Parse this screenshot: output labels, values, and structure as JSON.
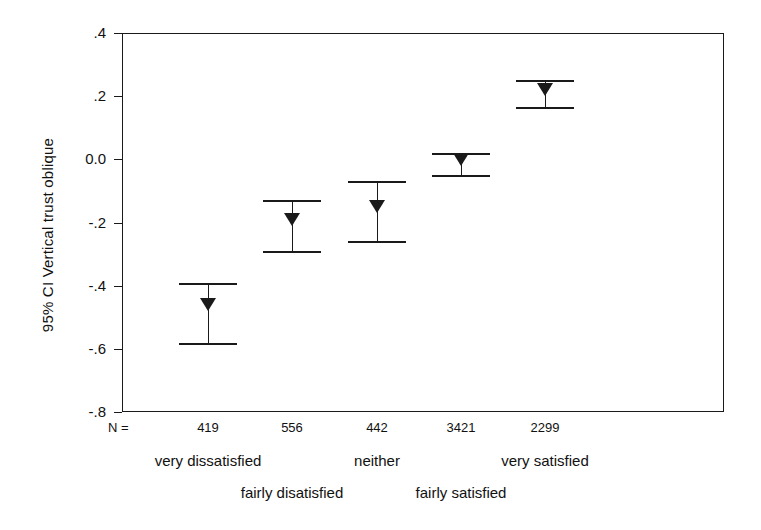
{
  "chart_data": {
    "type": "line",
    "title": "",
    "subtitle": "",
    "ylabel": "95% CI Vertical trust oblique",
    "xlabel": "",
    "ylim": [
      -0.8,
      0.4
    ],
    "ytick_labels": [
      ".4",
      ".2",
      "0.0",
      "-.2",
      "-.4",
      "-.6",
      "-.8"
    ],
    "ytick_values": [
      0.4,
      0.2,
      0.0,
      -0.2,
      -0.4,
      -0.6,
      -0.8
    ],
    "grid": false,
    "legend": "none",
    "n_prefix": "N =",
    "categories": [
      "very dissatisfied",
      "fairly disatisfied",
      "neither",
      "fairly satisfied",
      "very satisfied"
    ],
    "n_values": [
      "419",
      "556",
      "442",
      "3421",
      "2299"
    ],
    "series": [
      {
        "name": "95% CI Vertical trust oblique",
        "means": [
          -0.48,
          -0.21,
          -0.17,
          -0.02,
          0.2
        ],
        "ci_upper": [
          -0.39,
          -0.13,
          -0.07,
          0.02,
          0.25
        ],
        "ci_lower": [
          -0.58,
          -0.29,
          -0.26,
          -0.05,
          0.165
        ]
      }
    ],
    "marker_style": "down-triangle",
    "line_color": "#1a1a1a",
    "background_color": "#ffffff"
  },
  "figure": {
    "y_axis_title": "95% CI Vertical trust oblique"
  }
}
